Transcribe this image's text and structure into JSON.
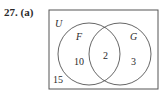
{
  "problem_label": "27. (a)",
  "venn": {
    "universe_label": "U",
    "set_a_label": "F",
    "set_b_label": "G",
    "only_a": "10",
    "intersection": "2",
    "only_b": "3",
    "outside": "15"
  },
  "colors": {
    "stroke": "#555555",
    "text": "#2a2a2a"
  }
}
